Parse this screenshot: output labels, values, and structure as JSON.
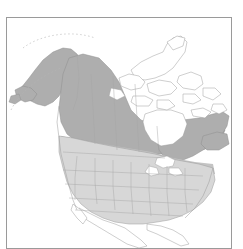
{
  "figure": {
    "type": "range-distribution-map",
    "region": "North America",
    "background_color": "#ffffff",
    "frame": {
      "visible": true,
      "color": "#9a9a9a",
      "x": 6,
      "y": 17,
      "width": 226,
      "height": 232
    }
  },
  "legend_colors": {
    "range_dark": "#aeaeae",
    "range_light": "#d7d7d7",
    "range_mid": "#c4c4c4",
    "outline": "#8e8e8e",
    "border_line": "#a6a6a6",
    "water": "#ffffff",
    "unshaded_land": "#ffffff"
  },
  "map": {
    "shaded_areas": [
      {
        "name": "alaska",
        "shade": "range_dark"
      },
      {
        "name": "western-canada",
        "shade": "range_dark"
      },
      {
        "name": "eastern-canada",
        "shade": "range_dark"
      },
      {
        "name": "northern-plains",
        "shade": "range_mid"
      },
      {
        "name": "contiguous-united-states",
        "shade": "range_light"
      }
    ],
    "unshaded_areas": [
      {
        "name": "canadian-arctic-archipelago"
      },
      {
        "name": "hudson-bay"
      },
      {
        "name": "great-lakes"
      },
      {
        "name": "mexico"
      },
      {
        "name": "greenland-edge"
      }
    ]
  },
  "caption": ""
}
